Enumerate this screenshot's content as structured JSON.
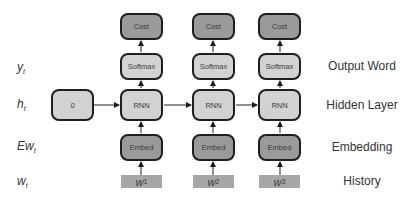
{
  "row_labels_left": [
    {
      "base": "y",
      "sub": "t"
    },
    {
      "base": "h",
      "sub": "t"
    },
    {
      "base": "Ew",
      "sub": "t"
    },
    {
      "base": "w",
      "sub": "t"
    }
  ],
  "row_labels_right": [
    "Output Word",
    "Hidden Layer",
    "Embedding",
    "History"
  ],
  "initial_state": "0",
  "columns": [
    {
      "cost": "Cost",
      "softmax": "Softmax",
      "rnn": "RNN",
      "embed": "Embed",
      "word": {
        "base": "w",
        "sub": "1"
      }
    },
    {
      "cost": "Cost",
      "softmax": "Softmax",
      "rnn": "RNN",
      "embed": "Embed",
      "word": {
        "base": "w",
        "sub": "2"
      }
    },
    {
      "cost": "Cost",
      "softmax": "Softmax",
      "rnn": "RNN",
      "embed": "Embed",
      "word": {
        "base": "w",
        "sub": "3"
      }
    }
  ],
  "colors": {
    "dark_node": "#9a9a9a",
    "light_node": "#d2d2d2",
    "history_box": "#a6a6a6",
    "border": "#1e1e1e"
  }
}
